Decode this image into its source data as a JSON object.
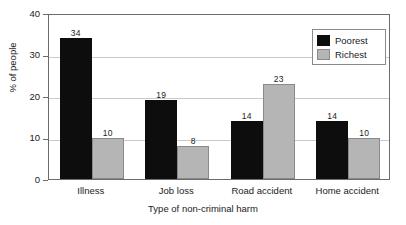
{
  "chart_data": {
    "type": "bar",
    "title": "",
    "subtitle": "",
    "xlabel": "Type of non-criminal harm",
    "ylabel": "% of people",
    "categories": [
      "Illness",
      "Job loss",
      "Road accident",
      "Home accident"
    ],
    "series": [
      {
        "name": "Poorest",
        "color": "#0d0d0d",
        "values": [
          34,
          19,
          14,
          14
        ]
      },
      {
        "name": "Richest",
        "color": "#b5b5b5",
        "values": [
          10,
          8,
          23,
          10
        ]
      }
    ],
    "ylim": [
      0,
      40
    ],
    "yticks": [
      0,
      10,
      20,
      30,
      40
    ],
    "ytick_labels": [
      "0",
      "10",
      "20",
      "30",
      "40"
    ],
    "grid": true,
    "grid_axis": "y",
    "legend_position": "top-right",
    "legend_entries": [
      "Poorest",
      "Richest"
    ],
    "bar_value_labels": true,
    "annotations": []
  },
  "legend": {
    "items": [
      {
        "label": "Poorest",
        "swatch": "black-square-swatch"
      },
      {
        "label": "Richest",
        "swatch": "gray-square-swatch"
      }
    ]
  }
}
